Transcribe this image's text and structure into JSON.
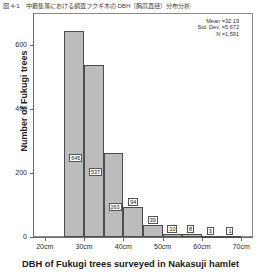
{
  "figure": {
    "caption_ja": "図 4-1　中筋集落における調査フクギ木の DBH（胸高直径）分布分析"
  },
  "chart_data": {
    "type": "bar",
    "title": "",
    "xlabel": "DBH of Fukugi trees surveyed in Nakasuji hamlet",
    "ylabel": "Number of Fukugi trees",
    "categories": [
      "25-30",
      "30-35",
      "35-40",
      "40-45",
      "45-50",
      "50-55",
      "55-60",
      "60-65",
      "65-70"
    ],
    "bin_starts_cm": [
      25,
      30,
      35,
      40,
      45,
      50,
      55,
      60,
      65
    ],
    "bin_width_cm": 5,
    "values": [
      645,
      537,
      263,
      94,
      39,
      10,
      8,
      3,
      1
    ],
    "bar_labels": [
      "645",
      "537",
      "263",
      "94",
      "39",
      "10",
      "8",
      "3",
      "1"
    ],
    "xlim": [
      17,
      73
    ],
    "ylim": [
      0,
      700
    ],
    "xticks": [
      20,
      30,
      40,
      50,
      60,
      70
    ],
    "xtick_labels": [
      "20cm",
      "30cm",
      "40cm",
      "50cm",
      "60cm",
      "70cm"
    ],
    "yticks": [
      0,
      200,
      400,
      600
    ],
    "ytick_labels": [
      "0",
      "200",
      "400",
      "600"
    ],
    "grid": false,
    "legend": "none",
    "bar_fill": "#bcbcbc",
    "bar_edge": "#4d4d4d"
  },
  "stats": {
    "mean": "Mean =32.19",
    "std_dev": "Std. Dev. =5.672",
    "n": "N =1,591"
  }
}
